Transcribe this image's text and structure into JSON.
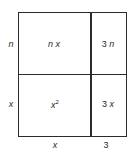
{
  "diagram": {
    "type": "area-model",
    "row_labels": [
      "n",
      "x"
    ],
    "column_labels": [
      "x",
      "3"
    ],
    "cells": [
      {
        "row": 0,
        "col": 0,
        "coef": "",
        "var": "n x",
        "exp": ""
      },
      {
        "row": 0,
        "col": 1,
        "coef": "3",
        "var": "n",
        "exp": ""
      },
      {
        "row": 1,
        "col": 0,
        "coef": "",
        "var": "x",
        "exp": "2"
      },
      {
        "row": 1,
        "col": 1,
        "coef": "3",
        "var": "x",
        "exp": ""
      }
    ],
    "line_color": "#2b2b2b",
    "text_color": "#2a2a2a"
  }
}
